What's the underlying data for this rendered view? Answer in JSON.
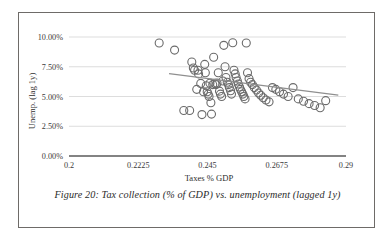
{
  "figure": {
    "caption": "Figure 20: Tax collection (% of GDP) vs. unemployment (lagged 1y)"
  },
  "chart_data": {
    "type": "scatter",
    "title": "",
    "xlabel": "Taxes % GDP",
    "ylabel": "Unemp. (lag 1y)",
    "xlim": [
      0.2,
      0.29
    ],
    "ylim": [
      0.0,
      0.1
    ],
    "xticks": [
      0.2,
      0.2225,
      0.245,
      0.2675,
      0.29
    ],
    "xtick_labels": [
      "0.2",
      "0.2225",
      "0.245",
      "0.2675",
      "0.29"
    ],
    "yticks": [
      0.0,
      0.025,
      0.05,
      0.075,
      0.1
    ],
    "ytick_labels": [
      "0.00%",
      "2.50%",
      "5.00%",
      "7.50%",
      "10.00%"
    ],
    "grid": "horizontal",
    "legend": null,
    "marker": {
      "shape": "circle",
      "filled": false,
      "edge_color": "#6b6b6b",
      "size": 4
    },
    "series": [
      {
        "name": "Countries",
        "x": [
          0.2293,
          0.2343,
          0.2373,
          0.2392,
          0.2399,
          0.2404,
          0.2408,
          0.2415,
          0.2419,
          0.2421,
          0.2428,
          0.2432,
          0.2437,
          0.2441,
          0.2443,
          0.2446,
          0.2449,
          0.2452,
          0.2455,
          0.2458,
          0.2461,
          0.2463,
          0.2467,
          0.247,
          0.2474,
          0.2478,
          0.2481,
          0.2485,
          0.2489,
          0.2492,
          0.2496,
          0.25,
          0.2503,
          0.2507,
          0.251,
          0.2514,
          0.2518,
          0.2521,
          0.2525,
          0.2528,
          0.2532,
          0.2536,
          0.254,
          0.2543,
          0.2547,
          0.255,
          0.2554,
          0.2557,
          0.2561,
          0.2565,
          0.2568,
          0.2572,
          0.2576,
          0.258,
          0.2585,
          0.259,
          0.2596,
          0.2602,
          0.2609,
          0.2616,
          0.2623,
          0.2631,
          0.264,
          0.265,
          0.2661,
          0.2672,
          0.2684,
          0.2697,
          0.2712,
          0.2728,
          0.2745,
          0.2762,
          0.278,
          0.2798,
          0.2816,
          0.2834
        ],
        "y": [
          0.095,
          0.089,
          0.0382,
          0.0382,
          0.079,
          0.074,
          0.072,
          0.056,
          0.072,
          0.069,
          0.061,
          0.0348,
          0.054,
          0.077,
          0.07,
          0.059,
          0.054,
          0.052,
          0.05,
          0.0612,
          0.0448,
          0.0352,
          0.06,
          0.083,
          0.061,
          0.06,
          0.0612,
          0.07,
          0.0545,
          0.052,
          0.05,
          0.063,
          0.093,
          0.075,
          0.066,
          0.062,
          0.06,
          0.0575,
          0.0548,
          0.052,
          0.0952,
          0.072,
          0.069,
          0.066,
          0.063,
          0.0605,
          0.058,
          0.056,
          0.054,
          0.052,
          0.05,
          0.048,
          0.095,
          0.07,
          0.065,
          0.062,
          0.06,
          0.0575,
          0.0555,
          0.053,
          0.051,
          0.049,
          0.047,
          0.0455,
          0.0575,
          0.056,
          0.054,
          0.052,
          0.05,
          0.0575,
          0.048,
          0.046,
          0.044,
          0.0425,
          0.0405,
          0.0465
        ]
      }
    ],
    "trendline": {
      "present": true,
      "color": "#8f8f8f",
      "x_start": 0.2325,
      "y_start": 0.0692,
      "x_end": 0.2875,
      "y_end": 0.0512
    }
  }
}
